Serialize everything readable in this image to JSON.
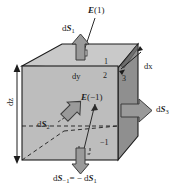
{
  "figure": {
    "name": "differential-volume-flux-cube",
    "palette": {
      "background": "#ffffff",
      "top_face": "#c9c9c9",
      "front_face": "#bcbcbc",
      "right_face": "#8f8f8f",
      "arrow_fill": "#9a9a9a",
      "arrow_stroke": "#3c3c3c",
      "edge": "#1c1c1c",
      "text": "#1c1c1c"
    },
    "labels": {
      "field_top": {
        "symbol": "E",
        "arg": "(1)",
        "text": "E(1)"
      },
      "field_inner": {
        "symbol": "E",
        "arg": "(−1)",
        "text": "E(−1)"
      },
      "area_top": {
        "symbol": "dS",
        "sub": "1",
        "text": "dS₁"
      },
      "area_left": {
        "symbol": "dS",
        "sub": "2",
        "text": "dS₂"
      },
      "area_right": {
        "symbol": "dS",
        "sub": "3",
        "text": "dS₃"
      },
      "area_bottom_eq": {
        "lhs_symbol": "dS",
        "lhs_sub": "−1",
        "relation": "=",
        "rhs": "− dS₁",
        "text": "dS₋₁ = − dS₁"
      },
      "dim_x": "dx",
      "dim_y": "dy",
      "dim_z": "dz",
      "face_index_top": "1",
      "face_index_front": "2",
      "face_index_right": "3",
      "face_index_bottom": "−1"
    },
    "arrows": [
      {
        "name": "dS1-arrow",
        "direction": "up",
        "label": "dS₁"
      },
      {
        "name": "dS2-arrow",
        "direction": "up-left",
        "label": "dS₂"
      },
      {
        "name": "dS3-arrow",
        "direction": "right",
        "label": "dS₃"
      },
      {
        "name": "dS-1-arrow",
        "direction": "down",
        "label": "dS₋₁"
      }
    ],
    "leader_lines": [
      {
        "name": "E1-leader",
        "from": "E(1)",
        "to": "top-face-center"
      },
      {
        "name": "Em1-leader",
        "from": "E(−1)",
        "to": "bottom-face-center"
      },
      {
        "name": "dx-leader",
        "from": "dx",
        "to": "top-right-edge"
      },
      {
        "name": "dS2-leader",
        "from": "dS₂",
        "to": "front-face-center"
      }
    ],
    "dimension_lines": [
      {
        "name": "dz-dimension",
        "orientation": "vertical",
        "label": "dz",
        "arrowheads": "both"
      }
    ]
  }
}
